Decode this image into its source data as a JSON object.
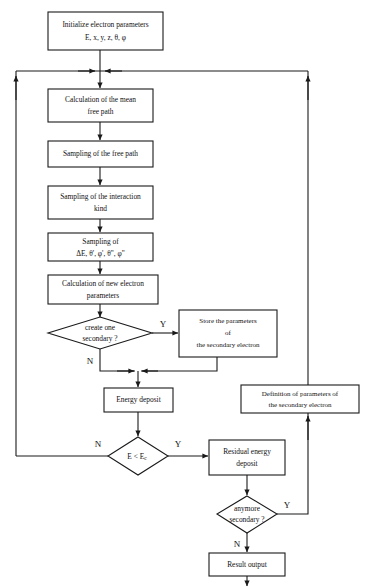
{
  "diagram": {
    "type": "flowchart",
    "colors": {
      "background": "#ffffff",
      "stroke": "#1a1a1a",
      "text": "#111111"
    },
    "nodes": [
      {
        "id": "init",
        "shape": "rectangle",
        "lines": [
          "Initialize electron parameters",
          "E, x, y, z, θ, φ"
        ]
      },
      {
        "id": "mean-free-path",
        "shape": "rectangle",
        "lines": [
          "Calculation of the mean",
          "free path"
        ]
      },
      {
        "id": "sampling-free-path",
        "shape": "rectangle",
        "lines": [
          "Sampling of the free path"
        ]
      },
      {
        "id": "sampling-interaction-kind",
        "shape": "rectangle",
        "lines": [
          "Sampling of the interaction",
          "kind"
        ]
      },
      {
        "id": "sampling-de",
        "shape": "rectangle",
        "lines": [
          "Sampling of",
          "ΔE, θ', φ', θ\", φ\""
        ]
      },
      {
        "id": "calc-new-params",
        "shape": "rectangle",
        "lines": [
          "Calculation of new electron",
          "parameters"
        ]
      },
      {
        "id": "create-secondary",
        "shape": "diamond",
        "lines": [
          "create one",
          "secondary ?"
        ]
      },
      {
        "id": "store-parameters",
        "shape": "rectangle",
        "lines": [
          "Store the parameters",
          "of",
          "the secondary electron"
        ]
      },
      {
        "id": "energy-deposit",
        "shape": "rectangle",
        "lines": [
          "Energy deposit"
        ]
      },
      {
        "id": "energy-threshold",
        "shape": "diamond",
        "lines": [
          "E < E",
          "c"
        ]
      },
      {
        "id": "residual-energy-deposit",
        "shape": "rectangle",
        "lines": [
          "Residual energy",
          "deposit"
        ]
      },
      {
        "id": "anymore-secondary",
        "shape": "diamond",
        "lines": [
          "anymore",
          "secondary ?"
        ]
      },
      {
        "id": "definition-parameters",
        "shape": "rectangle",
        "lines": [
          "Definition of parameters of",
          "the secondary electron"
        ]
      },
      {
        "id": "result-output",
        "shape": "rectangle",
        "lines": [
          "Result output"
        ]
      }
    ],
    "branch_labels": {
      "create_secondary_yes": "Y",
      "create_secondary_no": "N",
      "energy_threshold_no": "N",
      "energy_threshold_yes": "Y",
      "anymore_secondary_yes": "Y",
      "anymore_secondary_no": "N"
    },
    "text": {
      "init_l1": "Initialize electron parameters",
      "init_l2": "E, x, y, z, θ, φ",
      "mfp_l1": "Calculation of the mean",
      "mfp_l2": "free path",
      "sfp_l1": "Sampling of the free path",
      "sik_l1": "Sampling of the interaction",
      "sik_l2": "kind",
      "sde_l1": "Sampling of",
      "sde_l2": "ΔE, θ', φ', θ\", φ\"",
      "cnp_l1": "Calculation of new electron",
      "cnp_l2": "parameters",
      "cos_l1": "create one",
      "cos_l2": "secondary ?",
      "stp_l1": "Store the parameters",
      "stp_l2": "of",
      "stp_l3": "the secondary electron",
      "ed_l1": "Energy deposit",
      "et_main": "E < E",
      "et_sub": "c",
      "red_l1": "Residual energy",
      "red_l2": "deposit",
      "ams_l1": "anymore",
      "ams_l2": "secondary ?",
      "dfp_l1": "Definition of parameters of",
      "dfp_l2": "the secondary electron",
      "ro_l1": "Result output"
    }
  }
}
